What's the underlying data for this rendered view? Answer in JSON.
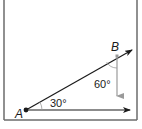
{
  "diagram": {
    "points": {
      "A": {
        "label": "A",
        "x": 26,
        "y": 110
      },
      "B": {
        "label": "B",
        "x": 117,
        "y": 56
      }
    },
    "angles": {
      "angle_at_A": {
        "label": "30°",
        "degrees": 30
      },
      "angle_at_B": {
        "label": "60°",
        "degrees": 60
      }
    },
    "vectors": [
      {
        "name": "AB",
        "from": "A",
        "through": "B",
        "color": "#1a1a1a"
      },
      {
        "name": "horizontal",
        "from": "A",
        "direction": "right",
        "color": "#1a1a1a"
      },
      {
        "name": "vertical-down",
        "from": "B",
        "direction": "down",
        "color": "#9a9a9a"
      }
    ],
    "frame_color": "#6b6b6b"
  }
}
